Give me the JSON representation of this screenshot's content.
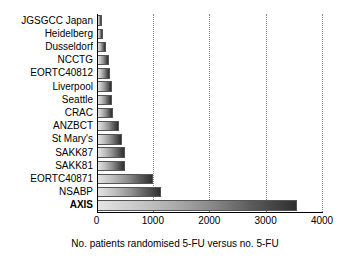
{
  "chart_data": {
    "type": "bar",
    "orientation": "horizontal",
    "title": "",
    "subtitle": "",
    "xlabel": "No. patients randomised 5-FU versus no. 5-FU",
    "ylabel": "",
    "xlim": [
      0,
      4000
    ],
    "xticks": [
      0,
      1000,
      2000,
      3000,
      4000
    ],
    "xtick_labels": [
      "0",
      "1000",
      "2000",
      "3000",
      "4000"
    ],
    "grid": "vertical-dotted",
    "legend": "none",
    "categories": [
      "JGSGCC Japan",
      "Heidelberg",
      "Dusseldorf",
      "NCCTG",
      "EORTC40812",
      "Liverpool",
      "Seattle",
      "CRAC",
      "ANZBCT",
      "St Mary's",
      "SAKK87",
      "SAKK81",
      "EORTC40871",
      "NSABP",
      "AXIS"
    ],
    "values": [
      100,
      110,
      160,
      230,
      240,
      270,
      280,
      300,
      400,
      460,
      500,
      510,
      1000,
      1140,
      3550
    ],
    "emphasized_categories": [
      "AXIS"
    ],
    "bar_fill": "gradient light-grey to dark-grey",
    "bar_colors": {
      "gradient_start": "#e4e4e4",
      "gradient_end": "#2f2f2f",
      "border": "#555555"
    },
    "grid_color": "#8a8a8a",
    "axis_color": "#000000",
    "background": "#ffffff"
  }
}
